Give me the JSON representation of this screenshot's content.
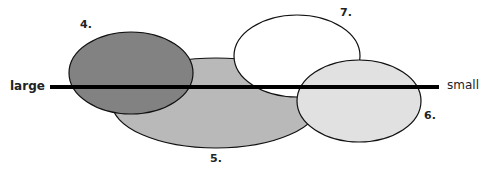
{
  "diagram": {
    "axis": {
      "left_label": "large",
      "right_label": "small"
    },
    "ellipses": [
      {
        "id": "5",
        "label": "5.",
        "fill": "#b8b8b8"
      },
      {
        "id": "4",
        "label": "4.",
        "fill": "#808080"
      },
      {
        "id": "7",
        "label": "7.",
        "fill": "#ffffff"
      },
      {
        "id": "6",
        "label": "6.",
        "fill": "#e0e0e0"
      }
    ]
  }
}
